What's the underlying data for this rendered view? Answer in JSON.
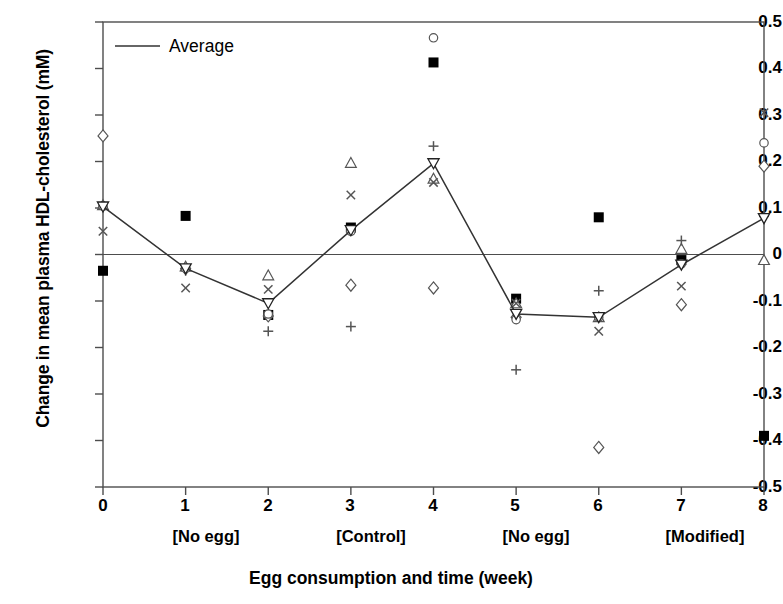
{
  "chart_data": {
    "type": "scatter",
    "title": "",
    "xlabel": "Egg consumption and time (week)",
    "ylabel": "Change in mean plasma HDL-cholesterol (mM)",
    "xlim": [
      0,
      8
    ],
    "ylim": [
      -0.5,
      0.5
    ],
    "grid": false,
    "zero_line": true,
    "x": [
      0,
      1,
      2,
      3,
      4,
      5,
      6,
      7,
      8
    ],
    "xticklabels": [
      "0",
      "1",
      "2",
      "3",
      "4",
      "5",
      "6",
      "7",
      "8"
    ],
    "yticklabels": [
      "0.5",
      "0.4",
      "0.3",
      "0.2",
      "0.1",
      "0",
      "-0.1",
      "-0.2",
      "-0.3",
      "-0.4",
      "-0.5"
    ],
    "yticks": [
      0.5,
      0.4,
      0.3,
      0.2,
      0.1,
      0,
      -0.1,
      -0.2,
      -0.3,
      -0.4,
      -0.5
    ],
    "group_labels": [
      {
        "label": "[No egg]",
        "x_center": 1.5
      },
      {
        "label": "[Control]",
        "x_center": 3.5
      },
      {
        "label": "[No egg]",
        "x_center": 5.5
      },
      {
        "label": "[Modified]",
        "x_center": 7.6
      }
    ],
    "legend": {
      "position": "top-left-inside",
      "entries": [
        {
          "label": "Average",
          "marker": "line"
        }
      ]
    },
    "series": [
      {
        "name": "Average",
        "marker": "inverted-triangle-open",
        "line": true,
        "values": [
          0.103,
          -0.03,
          -0.105,
          0.052,
          0.196,
          -0.128,
          -0.135,
          -0.022,
          0.078
        ]
      },
      {
        "name": "Subject A",
        "marker": "filled-square",
        "line": false,
        "values": [
          -0.035,
          0.083,
          -0.13,
          0.058,
          0.413,
          -0.095,
          0.08,
          -0.012,
          -0.39
        ]
      },
      {
        "name": "Subject B",
        "marker": "open-diamond",
        "line": false,
        "values": [
          0.255,
          -0.03,
          -0.132,
          -0.066,
          -0.072,
          -0.135,
          -0.415,
          -0.108,
          0.19
        ]
      },
      {
        "name": "Subject C",
        "marker": "open-triangle",
        "line": false,
        "values": [
          0.106,
          -0.026,
          -0.045,
          0.197,
          0.163,
          -0.105,
          -0.135,
          0.012,
          -0.012
        ]
      },
      {
        "name": "Subject D",
        "marker": "cross-x",
        "line": false,
        "values": [
          0.05,
          -0.072,
          -0.075,
          0.128,
          0.155,
          -0.105,
          -0.165,
          -0.068,
          0.305
        ]
      },
      {
        "name": "Subject E",
        "marker": "plus",
        "line": false,
        "values": [
          0.102,
          -0.035,
          -0.165,
          -0.155,
          0.233,
          -0.248,
          -0.078,
          0.03,
          0.082
        ]
      },
      {
        "name": "Subject F",
        "marker": "open-circle",
        "line": false,
        "values": [
          0.104,
          -0.03,
          -0.128,
          0.05,
          0.466,
          -0.14,
          -0.135,
          -0.02,
          0.24
        ]
      }
    ],
    "colors": {
      "line": "#333333",
      "marker_fill": "#000000",
      "marker_open": "#555555",
      "axis": "#4d4d4d"
    }
  }
}
